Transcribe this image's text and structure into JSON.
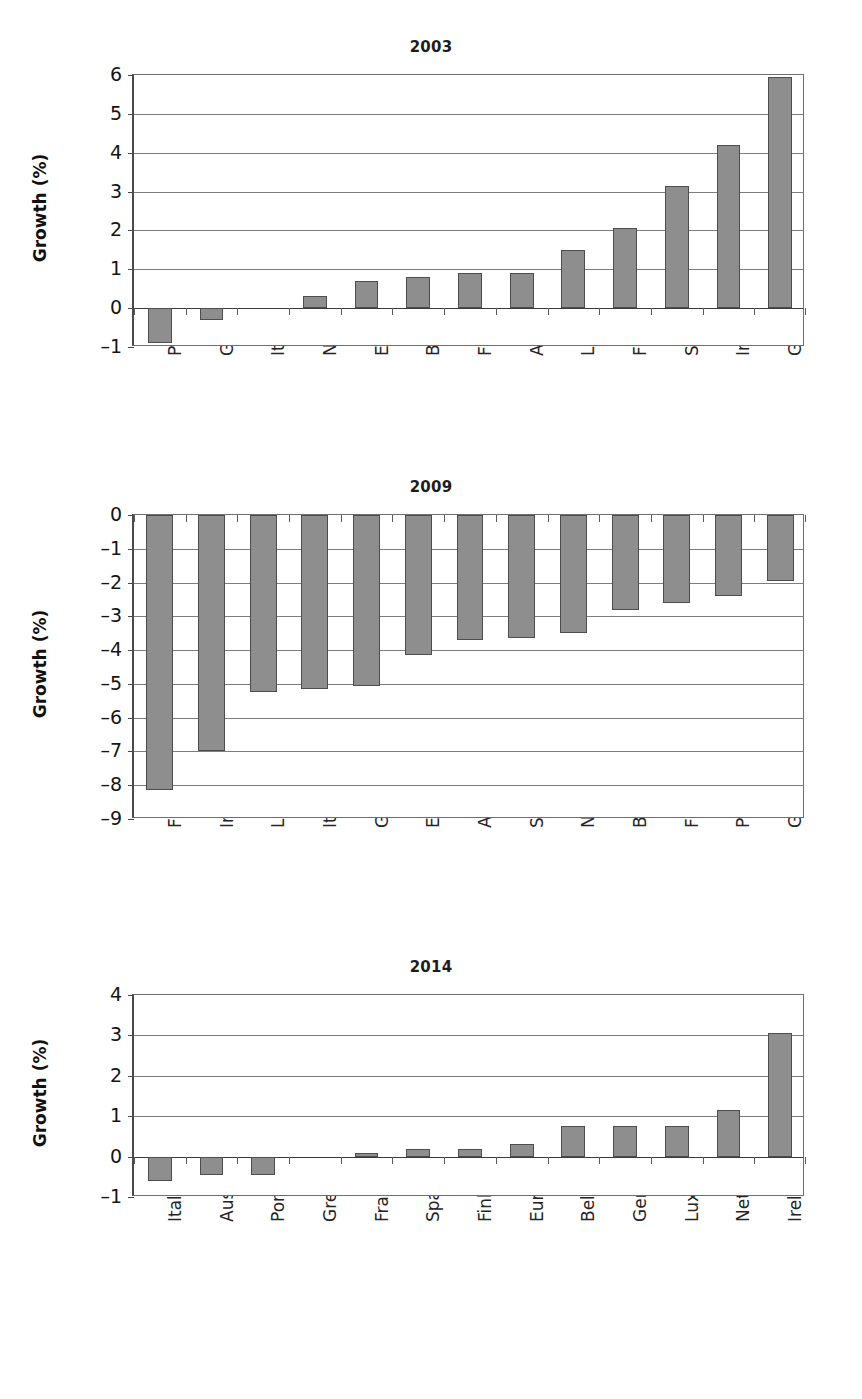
{
  "page": {
    "background": "#ffffff",
    "bar_color": "#8e8e8e",
    "bar_border_color": "#4d4d4d",
    "gridline_color": "#7d7d7d",
    "axis_color": "#4a4a4a"
  },
  "charts": [
    {
      "id": "chart-2003",
      "title": "2003",
      "ylabel": "Growth (%)",
      "ytick_labels": [
        "6",
        "5",
        "4",
        "3",
        "2",
        "1",
        "0",
        "–1"
      ]
    },
    {
      "id": "chart-2009",
      "title": "2009",
      "ylabel": "Growth (%)",
      "ytick_labels": [
        "0",
        "–1",
        "–2",
        "–3",
        "–4",
        "–5",
        "–6",
        "–7",
        "–8",
        "–9"
      ]
    },
    {
      "id": "chart-2014",
      "title": "2014",
      "ylabel": "Growth (%)",
      "ytick_labels": [
        "4",
        "3",
        "2",
        "1",
        "0",
        "–1"
      ]
    }
  ],
  "chart_data": [
    {
      "type": "bar",
      "title": "2003",
      "xlabel": "",
      "ylabel": "Growth (%)",
      "ylim": [
        -1,
        6
      ],
      "yticks": [
        -1,
        0,
        1,
        2,
        3,
        4,
        5,
        6
      ],
      "grid": true,
      "legend": "none",
      "categories": [
        "Portugal",
        "Germany",
        "Italy",
        "Netherlands",
        "Euro area",
        "Belgium",
        "France",
        "Austria",
        "Luxembourg",
        "Finland",
        "Spain",
        "Ireland",
        "Greece"
      ],
      "values": [
        -0.9,
        -0.3,
        0.0,
        0.3,
        0.7,
        0.8,
        0.9,
        0.9,
        1.5,
        2.05,
        3.15,
        4.2,
        5.95
      ]
    },
    {
      "type": "bar",
      "title": "2009",
      "xlabel": "",
      "ylabel": "Growth (%)",
      "ylim": [
        -9,
        0
      ],
      "yticks": [
        -9,
        -8,
        -7,
        -6,
        -5,
        -4,
        -3,
        -2,
        -1,
        0
      ],
      "grid": true,
      "legend": "none",
      "categories": [
        "Finland",
        "Ireland",
        "Luxembourg",
        "Italy",
        "Germany",
        "Euro area",
        "Austria",
        "Spain",
        "Netherlands",
        "Belgium",
        "France",
        "Portugal",
        "Greece"
      ],
      "values": [
        -8.15,
        -7.0,
        -5.25,
        -5.15,
        -5.05,
        -4.15,
        -3.7,
        -3.65,
        -3.5,
        -2.8,
        -2.6,
        -2.4,
        -1.95
      ]
    },
    {
      "type": "bar",
      "title": "2014",
      "xlabel": "",
      "ylabel": "Growth (%)",
      "ylim": [
        -1,
        4
      ],
      "yticks": [
        -1,
        0,
        1,
        2,
        3,
        4
      ],
      "grid": true,
      "legend": "none",
      "categories": [
        "Italy",
        "Austria",
        "Portugal",
        "Greece",
        "France",
        "Spain",
        "Finland",
        "Euro area",
        "Belgium",
        "Germany",
        "Luxembourg",
        "Netherlands",
        "Ireland"
      ],
      "values": [
        -0.6,
        -0.45,
        -0.45,
        0.0,
        0.1,
        0.2,
        0.2,
        0.3,
        0.75,
        0.75,
        0.75,
        1.15,
        3.05
      ]
    }
  ]
}
